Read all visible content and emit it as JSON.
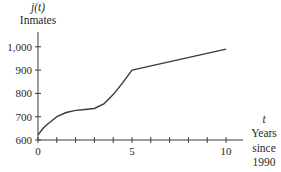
{
  "chart_data": {
    "type": "line",
    "title": "",
    "ylabel_symbol": "j(t)",
    "ylabel": "Inmates",
    "xlabel_symbol": "t",
    "xlabel_lines": [
      "Years",
      "since",
      "1990"
    ],
    "xlim": [
      0,
      10.9
    ],
    "ylim": [
      600,
      1030
    ],
    "x_ticks": [
      0,
      1,
      2,
      3,
      4,
      5,
      6,
      7,
      8,
      9,
      10
    ],
    "x_tick_labels": [
      {
        "value": 0,
        "label": "0"
      },
      {
        "value": 5,
        "label": "5"
      },
      {
        "value": 10,
        "label": "10"
      }
    ],
    "y_ticks": [
      600,
      700,
      800,
      900,
      1000
    ],
    "y_tick_labels": [
      "600",
      "700",
      "800",
      "900",
      "1,000"
    ],
    "grid": false,
    "legend": null,
    "series": [
      {
        "name": "j(t)",
        "x": [
          0,
          0.25,
          0.5,
          1,
          1.5,
          2,
          2.5,
          3,
          3.5,
          4,
          4.5,
          5,
          10
        ],
        "y": [
          622,
          648,
          668,
          700,
          718,
          727,
          731,
          735,
          755,
          795,
          845,
          900,
          990
        ]
      }
    ]
  },
  "colors": {
    "line": "#3a3a3a",
    "axis": "#3a3a3a",
    "text": "#2a2a2a"
  }
}
